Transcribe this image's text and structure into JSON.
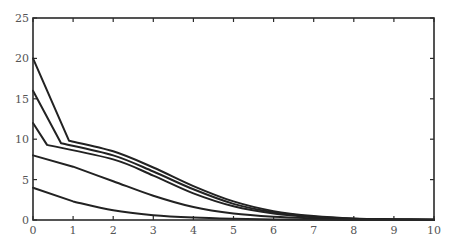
{
  "chart_data": {
    "type": "line",
    "title": "",
    "xlabel": "",
    "ylabel": "",
    "xlim": [
      0,
      10
    ],
    "ylim": [
      0,
      25
    ],
    "grid": false,
    "legend": null,
    "x_ticks": [
      0,
      1,
      2,
      3,
      4,
      5,
      6,
      7,
      8,
      9,
      10
    ],
    "y_ticks": [
      0,
      5,
      10,
      15,
      20,
      25
    ],
    "series": [
      {
        "name": "curve-20",
        "x": [
          0,
          0.9,
          2,
          3,
          4,
          5,
          6,
          7,
          8,
          9,
          10
        ],
        "y": [
          20,
          9.8,
          8.5,
          6.5,
          4.2,
          2.3,
          1.1,
          0.5,
          0.2,
          0.1,
          0.05
        ]
      },
      {
        "name": "curve-16",
        "x": [
          0,
          0.7,
          2,
          3,
          4,
          5,
          6,
          7,
          8,
          9,
          10
        ],
        "y": [
          16,
          9.5,
          8.0,
          6.0,
          3.8,
          2.0,
          0.95,
          0.4,
          0.15,
          0.07,
          0.03
        ]
      },
      {
        "name": "curve-12",
        "x": [
          0,
          0.35,
          2,
          3,
          4,
          5,
          6,
          7,
          8,
          9,
          10
        ],
        "y": [
          12,
          9.3,
          7.5,
          5.5,
          3.3,
          1.7,
          0.8,
          0.35,
          0.12,
          0.05,
          0.02
        ]
      },
      {
        "name": "curve-8",
        "x": [
          0,
          1,
          2,
          3,
          4,
          5,
          6,
          7,
          8,
          9,
          10
        ],
        "y": [
          8,
          6.6,
          4.8,
          3.0,
          1.6,
          0.8,
          0.4,
          0.2,
          0.08,
          0.03,
          0.01
        ]
      },
      {
        "name": "curve-4",
        "x": [
          0,
          1,
          2,
          3,
          4,
          5,
          6,
          7,
          8,
          9,
          10
        ],
        "y": [
          4,
          2.3,
          1.2,
          0.6,
          0.3,
          0.15,
          0.07,
          0.03,
          0.01,
          0,
          0
        ]
      }
    ]
  },
  "colors": {
    "axis": "#2a2a2a",
    "line": "#222222",
    "tick_label": "#555555",
    "background": "#ffffff"
  }
}
